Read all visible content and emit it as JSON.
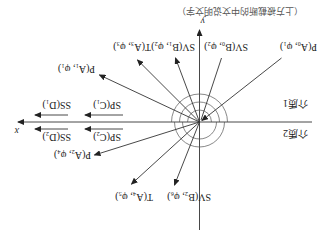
{
  "diagram": {
    "orientation": "rotated 180 degrees (upside-down)",
    "header_text": "（上方被截断的中文说明文字）",
    "axes": {
      "x_label": "x",
      "y_label": "y"
    },
    "media": [
      {
        "id": "medium1",
        "label": "介质1"
      },
      {
        "id": "medium2",
        "label": "介质2"
      }
    ],
    "rays": [
      {
        "id": "p-a0",
        "label": "P(A₀, φ₁)",
        "role": "incident"
      },
      {
        "id": "sv-b0",
        "label": "SV(B₀, φ₂)",
        "role": "incident"
      },
      {
        "id": "sv-b1",
        "label": "SV(B₁, φ₂)",
        "role": "reflected"
      },
      {
        "id": "t-a3",
        "label": "T(A₃, φ₃)",
        "role": "reflected"
      },
      {
        "id": "p-a1",
        "label": "P(A₁, φ₁)",
        "role": "reflected"
      },
      {
        "id": "p-a2",
        "label": "P(A₂, φ₄)",
        "role": "refracted"
      },
      {
        "id": "t-a4",
        "label": "T(A₄, φ₅)",
        "role": "refracted"
      },
      {
        "id": "sv-b2",
        "label": "SV(B₂, φ₆)",
        "role": "refracted"
      }
    ],
    "surface_waves": [
      {
        "id": "sp-c1",
        "label": "SP(C₁)"
      },
      {
        "id": "ss-d1",
        "label": "SS(D₁)"
      },
      {
        "id": "sp-c2",
        "label": "SP(C₂)"
      },
      {
        "id": "ss-d2",
        "label": "SS(D₂)"
      }
    ],
    "colors": {
      "line": "#333333",
      "arc": "#555555",
      "background": "#ffffff"
    }
  }
}
